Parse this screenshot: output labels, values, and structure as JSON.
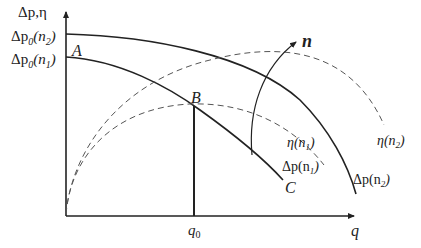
{
  "diagram": {
    "type": "pump characteristic curves",
    "axes": {
      "y_label": "Δp,η",
      "x_label": "q",
      "q0_label": "q",
      "q0_sub": "0"
    },
    "y_ticks": [
      {
        "main": "Δp",
        "sub": "0",
        "arg": "(n",
        "argsub": "2",
        "close": ")"
      },
      {
        "main": "Δp",
        "sub": "0",
        "arg": "(n",
        "argsub": "1",
        "close": ")"
      }
    ],
    "points": {
      "A": "A",
      "B": "B",
      "C": "C"
    },
    "curves": {
      "dp_n1": {
        "label": "Δp(n",
        "sub": "1",
        "close": ")"
      },
      "dp_n2": {
        "label": "Δp(n",
        "sub": "2",
        "close": ")"
      },
      "eta_n1": {
        "label": "η(n",
        "sub": "1",
        "close": ")"
      },
      "eta_n2": {
        "label": "η(n",
        "sub": "2",
        "close": ")"
      }
    },
    "arrow_label": "n",
    "colors": {
      "line": "#222222",
      "dashed": "#555555",
      "background": "#ffffff"
    }
  }
}
